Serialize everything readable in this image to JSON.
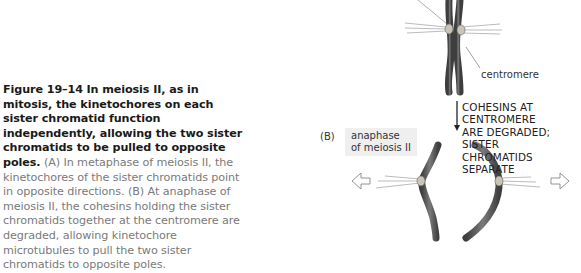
{
  "caption": {
    "figure_number": "Figure 19–14",
    "title_bold": "In meiosis II, as in mitosis, the kinetochores on each sister chromatid function independently, allowing the two sister chromatids to be pulled to opposite poles.",
    "body": "(A) In metaphase of meiosis II, the kinetochores of the sister chromatids point in opposite directions. (B) At anaphase of meiosis II, the cohesins holding the sister chromatids together at the centromere are degraded, allowing kinetochore microtubules to pull the two sister chromatids to opposite poles."
  },
  "diagram": {
    "centromere_label": "centromere",
    "step_label_lines": [
      "COHESINS AT CENTROMERE",
      "ARE DEGRADED; SISTER",
      "CHROMATIDS SEPARATE"
    ],
    "panel_b_letter": "(B)",
    "panel_b_phase_lines": [
      "anaphase",
      "of meiosis II"
    ]
  },
  "colors": {
    "chromatid": "#5a5a5a",
    "text_gray": "#7a7a7a",
    "label_box": "#efefef"
  }
}
